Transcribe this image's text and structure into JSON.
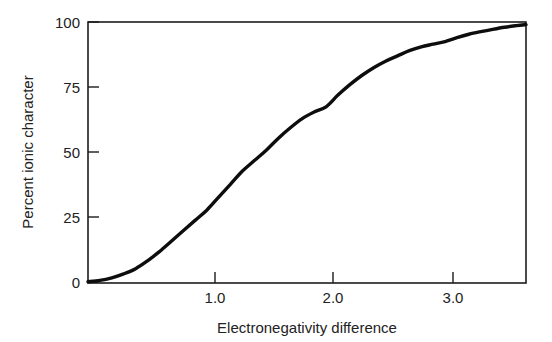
{
  "chart_data": {
    "type": "line",
    "title": "",
    "xlabel": "Electronegativity difference",
    "ylabel": "Percent ionic character",
    "xlim": [
      0,
      3.68
    ],
    "ylim": [
      0,
      100
    ],
    "grid": false,
    "legend": "none",
    "xticks": [
      1.0,
      2.0,
      3.0
    ],
    "xtick_labels": [
      "1.0",
      "2.0",
      "3.0"
    ],
    "yticks": [
      0,
      25,
      50,
      75,
      100
    ],
    "ytick_labels": [
      "0",
      "25",
      "50",
      "75",
      "100"
    ],
    "series": [
      {
        "name": "Percent ionic character",
        "color": "#0d0d0d",
        "x": [
          0.0,
          0.1,
          0.2,
          0.3,
          0.4,
          0.5,
          0.6,
          0.7,
          0.8,
          0.9,
          1.0,
          1.1,
          1.2,
          1.3,
          1.4,
          1.5,
          1.6,
          1.7,
          1.8,
          1.9,
          2.0,
          2.1,
          2.2,
          2.3,
          2.4,
          2.5,
          2.6,
          2.7,
          2.8,
          2.9,
          3.0,
          3.1,
          3.2,
          3.3,
          3.4,
          3.5,
          3.6,
          3.68
        ],
        "y": [
          0.5,
          1.0,
          2.0,
          3.5,
          5.5,
          8.5,
          12.0,
          16.0,
          20.0,
          24.0,
          28.0,
          33.0,
          38.0,
          43.0,
          47.0,
          51.0,
          55.5,
          59.5,
          63.0,
          65.5,
          67.5,
          72.0,
          76.0,
          79.5,
          82.5,
          85.0,
          87.0,
          89.0,
          90.5,
          91.5,
          92.5,
          94.0,
          95.3,
          96.3,
          97.2,
          98.0,
          98.6,
          99.0
        ]
      }
    ],
    "annotations": []
  },
  "figure": {
    "name": "percent-ionic-character-plot",
    "background_color": "#ffffff",
    "frame_color": "#1c1c1c",
    "curve_color": "#0d0d0d"
  }
}
